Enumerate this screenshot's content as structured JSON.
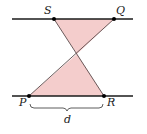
{
  "diagram": {
    "points": {
      "S": "S",
      "Q": "Q",
      "P": "P",
      "R": "R"
    },
    "distance_label": "d",
    "segments": [
      "SR",
      "PQ"
    ],
    "shaded_regions": [
      "triangle S-Q-X",
      "triangle P-R-X"
    ],
    "colors": {
      "fill": "#f4cdcc",
      "line": "#1a1a1a",
      "segment": "#5a4a4a"
    }
  }
}
